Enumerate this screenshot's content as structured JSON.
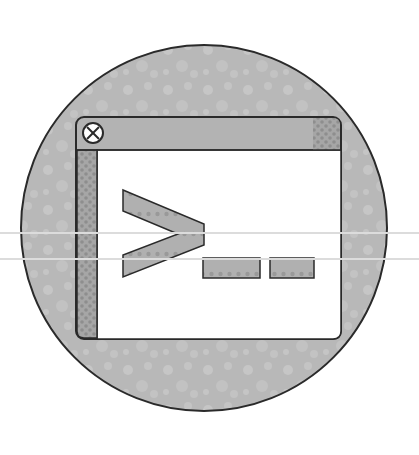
{
  "icon": {
    "name": "terminal",
    "prompt_glyph": ">_",
    "colors": {
      "background": "#ffffff",
      "circle_fill": "#b9b9b9",
      "circle_texture": "#c9c9c9",
      "outline": "#2a2a2a",
      "window_frame": "#b3b3b3",
      "window_body": "#ffffff",
      "checker": "#9a9a9a",
      "checker_dot": "#888888",
      "glyph_fill": "#a8a8a8",
      "close_button_fill": "#ffffff",
      "guide_line": "#dcdcdc"
    }
  }
}
